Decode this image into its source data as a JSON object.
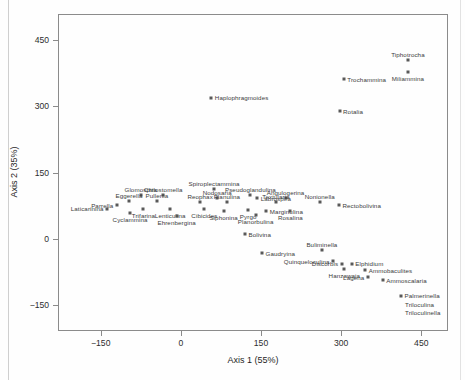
{
  "chart_data": {
    "type": "scatter",
    "title": "",
    "xlabel": "Axis 1 (55%)",
    "ylabel": "Axis 2 (35%)",
    "xlim": [
      -230,
      500
    ],
    "ylim": [
      -210,
      510
    ],
    "xticks": [
      -150,
      0,
      150,
      300,
      450
    ],
    "xticklabels": [
      "−150",
      "0",
      "150",
      "300",
      "450"
    ],
    "yticks": [
      -150,
      0,
      150,
      300,
      450
    ],
    "yticklabels": [
      "−150",
      "0",
      "150",
      "300",
      "450"
    ],
    "grid": false,
    "legend": "none",
    "marker_color": "#595959",
    "frame_color": "#8b8b8b",
    "points": [
      {
        "label": "Tiphotrocha",
        "x": 425,
        "y": 405,
        "pos": "above"
      },
      {
        "label": "Miliammina",
        "x": 425,
        "y": 378,
        "pos": "below"
      },
      {
        "label": "Trochammina",
        "x": 305,
        "y": 362,
        "pos": "right"
      },
      {
        "label": "Rotalia",
        "x": 297,
        "y": 289,
        "pos": "right"
      },
      {
        "label": "Haplophragmoides",
        "x": 57,
        "y": 320,
        "pos": "right"
      },
      {
        "label": "Spiroplectammina",
        "x": 62,
        "y": 113,
        "pos": "above"
      },
      {
        "label": "Pseudoglandulina",
        "x": 130,
        "y": 100,
        "pos": "above"
      },
      {
        "label": "Glomospira",
        "x": -75,
        "y": 100,
        "pos": "above"
      },
      {
        "label": "Chilostomella",
        "x": -33,
        "y": 100,
        "pos": "above"
      },
      {
        "label": "Nodosaria",
        "x": 68,
        "y": 92,
        "pos": "above"
      },
      {
        "label": "Labrospira",
        "x": 143,
        "y": 92,
        "pos": "right"
      },
      {
        "label": "Angulogerina",
        "x": 196,
        "y": 92,
        "pos": "above"
      },
      {
        "label": "Eggerella",
        "x": -97,
        "y": 86,
        "pos": "above"
      },
      {
        "label": "Pullenia",
        "x": -45,
        "y": 86,
        "pos": "above"
      },
      {
        "label": "Reophax",
        "x": 36,
        "y": 84,
        "pos": "above"
      },
      {
        "label": "Planulina",
        "x": 86,
        "y": 84,
        "pos": "above"
      },
      {
        "label": "Textularia",
        "x": 178,
        "y": 82,
        "pos": "above"
      },
      {
        "label": "Nonionella",
        "x": 260,
        "y": 84,
        "pos": "above"
      },
      {
        "label": "Parrella",
        "x": -120,
        "y": 76,
        "pos": "left"
      },
      {
        "label": "Laticarinina",
        "x": -138,
        "y": 68,
        "pos": "left"
      },
      {
        "label": "Trifarina",
        "x": -70,
        "y": 66,
        "pos": "below"
      },
      {
        "label": "Cyclammina",
        "x": -95,
        "y": 58,
        "pos": "below"
      },
      {
        "label": "Lenticulina",
        "x": -20,
        "y": 66,
        "pos": "below"
      },
      {
        "label": "Cibicides",
        "x": 44,
        "y": 68,
        "pos": "below"
      },
      {
        "label": "Ehrenbergina",
        "x": -8,
        "y": 52,
        "pos": "below"
      },
      {
        "label": "Siphonina",
        "x": 80,
        "y": 62,
        "pos": "below"
      },
      {
        "label": "Pyrgo",
        "x": 126,
        "y": 64,
        "pos": "below"
      },
      {
        "label": "Marginulina",
        "x": 160,
        "y": 62,
        "pos": "right"
      },
      {
        "label": "Planorbulina",
        "x": 140,
        "y": 54,
        "pos": "below"
      },
      {
        "label": "Rosalina",
        "x": 205,
        "y": 62,
        "pos": "below"
      },
      {
        "label": "Rectobolivina",
        "x": 296,
        "y": 76,
        "pos": "right"
      },
      {
        "label": "Bolivina",
        "x": 120,
        "y": 10,
        "pos": "right"
      },
      {
        "label": "Gaudryina",
        "x": 152,
        "y": -33,
        "pos": "right"
      },
      {
        "label": "Buliminella",
        "x": 264,
        "y": -27,
        "pos": "above"
      },
      {
        "label": "Quinqueloculina",
        "x": 285,
        "y": -52,
        "pos": "left"
      },
      {
        "label": "Discorbis",
        "x": 301,
        "y": -57,
        "pos": "left"
      },
      {
        "label": "Elphidium",
        "x": 320,
        "y": -57,
        "pos": "right"
      },
      {
        "label": "Hanzawaia",
        "x": 306,
        "y": -70,
        "pos": "below"
      },
      {
        "label": "Ammobaculites",
        "x": 345,
        "y": -72,
        "pos": "right"
      },
      {
        "label": "Lagena",
        "x": 350,
        "y": -88,
        "pos": "left"
      },
      {
        "label": "Ammoscalaria",
        "x": 378,
        "y": -95,
        "pos": "right"
      },
      {
        "label": "Palmerinella",
        "x": 412,
        "y": -130,
        "pos": "right"
      },
      {
        "label": "Triloculina",
        "x": null,
        "y": null,
        "pos": "textonly-1"
      },
      {
        "label": "Triloculinella",
        "x": null,
        "y": null,
        "pos": "textonly-2"
      }
    ]
  },
  "axes": {
    "x_title": "Axis 1 (55%)",
    "y_title": "Axis 2 (35%)"
  }
}
